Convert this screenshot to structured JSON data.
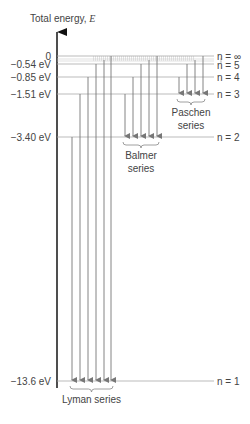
{
  "diagram": {
    "axis_label": "Total energy,",
    "axis_symbol": "E",
    "levels": [
      {
        "n": "∞",
        "label": "n = ∞",
        "energy_label": "0",
        "energy_ev": 0
      },
      {
        "n": "5",
        "label": "n = 5",
        "energy_label": "−0.54 eV",
        "energy_ev": -0.54
      },
      {
        "n": "4",
        "label": "n = 4",
        "energy_label": "−0.85 eV",
        "energy_ev": -0.85
      },
      {
        "n": "3",
        "label": "n = 3",
        "energy_label": "−1.51 eV",
        "energy_ev": -1.51
      },
      {
        "n": "2",
        "label": "n = 2",
        "energy_label": "−3.40 eV",
        "energy_ev": -3.4
      },
      {
        "n": "1",
        "label": "n = 1",
        "energy_label": "−13.6 eV",
        "energy_ev": -13.6
      }
    ],
    "series": [
      {
        "name": "Lyman series",
        "line1": "Lyman series",
        "line2": "",
        "final_n": 1,
        "initial_n": [
          "2",
          "3",
          "4",
          "5",
          "6",
          "∞"
        ]
      },
      {
        "name": "Balmer series",
        "line1": "Balmer",
        "line2": "series",
        "final_n": 2,
        "initial_n": [
          "3",
          "4",
          "5",
          "6",
          "∞"
        ]
      },
      {
        "name": "Paschen series",
        "line1": "Paschen",
        "line2": "series",
        "final_n": 3,
        "initial_n": [
          "4",
          "5",
          "6",
          "∞"
        ]
      }
    ],
    "colors": {
      "axis": "#222222",
      "level_line": "#aaaaaa",
      "transition": "#777777",
      "text": "#444444"
    }
  }
}
